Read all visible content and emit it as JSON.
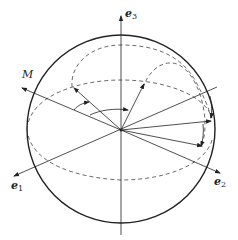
{
  "figure": {
    "labels": {
      "e3": {
        "base": "e",
        "sub": "3"
      },
      "e1": {
        "base": "e",
        "sub": "1"
      },
      "e2": {
        "base": "e",
        "sub": "2"
      },
      "M": "M"
    },
    "colors": {
      "stroke": "#222222",
      "background": "#ffffff"
    },
    "elements": [
      "sphere-outline",
      "equator-dashed-ellipse",
      "meridian-dashed-arc-left",
      "meridian-dashed-arc-right",
      "axis-e1",
      "axis-e2",
      "axis-e3",
      "axis-M",
      "rotated-vectors",
      "angle-arc"
    ]
  }
}
